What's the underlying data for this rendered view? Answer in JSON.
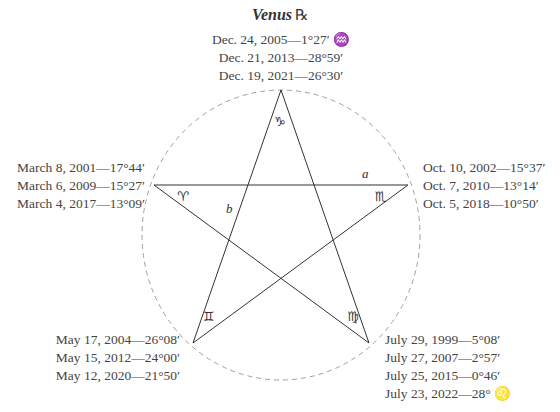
{
  "title": {
    "planet": "Venus",
    "retrograde_symbol": "℞"
  },
  "diagram": {
    "type": "pentagram-in-circle",
    "points": {
      "top": {
        "sign_symbol": "♑",
        "sign": "Capricorn"
      },
      "left": {
        "sign_symbol": "♈",
        "sign": "Aries"
      },
      "right": {
        "sign_symbol": "♏",
        "sign": "Scorpio"
      },
      "bottom_left": {
        "sign_symbol": "♊",
        "sign": "Gemini"
      },
      "bottom_right": {
        "sign_symbol": "♍",
        "sign": "Virgo"
      }
    },
    "labels": {
      "a": "a",
      "b": "b"
    }
  },
  "dates": {
    "top": [
      "Dec. 24, 2005—1°27′ ♒",
      "Dec. 21, 2013—28°59′",
      "Dec. 19, 2021—26°30′"
    ],
    "left": [
      "March 8, 2001—17°44′",
      "March 6, 2009—15°27′",
      "March 4, 2017—13°09′"
    ],
    "right": [
      "Oct. 10, 2002—15°37′",
      "Oct. 7, 2010—13°14′",
      "Oct. 5, 2018—10°50′"
    ],
    "bottom_left": [
      "May 17, 2004—26°08′",
      "May 15, 2012—24°00′",
      "May 12, 2020—21°50′"
    ],
    "bottom_right": [
      "July 29, 1999—5°08′",
      "July 27, 2007—2°57′",
      "July 25, 2015—0°46′",
      "July 23, 2022—28° ♌"
    ]
  },
  "colors": {
    "lines": "#333333",
    "circle": "#999999",
    "text": "#444444"
  }
}
